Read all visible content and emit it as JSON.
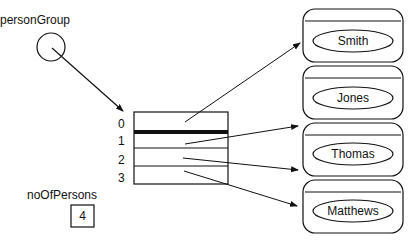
{
  "diagram": {
    "variable_label": "personGroup",
    "counter_label": "noOfPersons",
    "counter_value": "4",
    "array": {
      "indices": [
        "0",
        "1",
        "2",
        "3"
      ]
    },
    "objects": [
      {
        "name": "Smith"
      },
      {
        "name": "Jones"
      },
      {
        "name": "Thomas"
      },
      {
        "name": "Matthews"
      }
    ]
  }
}
